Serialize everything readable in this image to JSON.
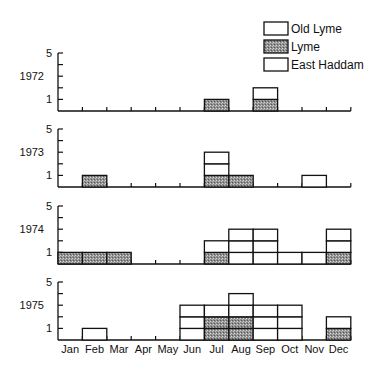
{
  "chart_data": {
    "type": "bar",
    "subtype": "stacked-histogram-small-multiples",
    "title": "",
    "xlabel": "",
    "ylabel": "",
    "categories": [
      "Jan",
      "Feb",
      "Mar",
      "Apr",
      "May",
      "Jun",
      "Jul",
      "Aug",
      "Sep",
      "Oct",
      "Nov",
      "Dec"
    ],
    "ylim": [
      0,
      5
    ],
    "yticks_labeled": [
      1,
      5
    ],
    "legend": {
      "position": "top-right",
      "entries": [
        {
          "name": "Old Lyme",
          "fill": "white"
        },
        {
          "name": "Lyme",
          "fill": "hatched"
        },
        {
          "name": "East Haddam",
          "fill": "white"
        }
      ]
    },
    "panels": [
      {
        "year": "1972",
        "stacks": {
          "Jul": [
            "Lyme"
          ],
          "Sep": [
            "Lyme",
            "white"
          ]
        },
        "totals": [
          0,
          0,
          0,
          0,
          0,
          0,
          1,
          0,
          2,
          0,
          0,
          0
        ],
        "lyme": [
          0,
          0,
          0,
          0,
          0,
          0,
          1,
          0,
          1,
          0,
          0,
          0
        ]
      },
      {
        "year": "1973",
        "stacks": {
          "Feb": [
            "Lyme"
          ],
          "Jul": [
            "Lyme",
            "white",
            "white"
          ],
          "Aug": [
            "Lyme"
          ],
          "Nov": [
            "white"
          ]
        },
        "totals": [
          0,
          1,
          0,
          0,
          0,
          0,
          3,
          1,
          0,
          0,
          1,
          0
        ],
        "lyme": [
          0,
          1,
          0,
          0,
          0,
          0,
          1,
          1,
          0,
          0,
          0,
          0
        ]
      },
      {
        "year": "1974",
        "stacks": {
          "Jan": [
            "Lyme"
          ],
          "Feb": [
            "Lyme"
          ],
          "Mar": [
            "Lyme"
          ],
          "Jul": [
            "Lyme",
            "white"
          ],
          "Aug": [
            "white",
            "white",
            "white"
          ],
          "Sep": [
            "white",
            "white",
            "white"
          ],
          "Oct": [
            "white"
          ],
          "Nov": [
            "white"
          ],
          "Dec": [
            "Lyme",
            "white",
            "white"
          ]
        },
        "totals": [
          1,
          1,
          1,
          0,
          0,
          0,
          2,
          3,
          3,
          1,
          1,
          3
        ],
        "lyme": [
          1,
          1,
          1,
          0,
          0,
          0,
          1,
          0,
          0,
          0,
          0,
          1
        ]
      },
      {
        "year": "1975",
        "stacks": {
          "Feb": [
            "white"
          ],
          "Jun": [
            "white",
            "white",
            "white"
          ],
          "Jul": [
            "Lyme",
            "Lyme",
            "white"
          ],
          "Aug": [
            "Lyme",
            "Lyme",
            "white",
            "white"
          ],
          "Sep": [
            "white",
            "white",
            "white"
          ],
          "Oct": [
            "white",
            "white",
            "white"
          ],
          "Dec": [
            "Lyme",
            "white"
          ]
        },
        "totals": [
          0,
          1,
          0,
          0,
          0,
          3,
          3,
          4,
          3,
          3,
          0,
          2
        ],
        "lyme": [
          0,
          0,
          0,
          0,
          0,
          0,
          2,
          2,
          0,
          0,
          0,
          1
        ]
      }
    ]
  },
  "colors": {
    "axis": "#111111",
    "hatch_bg": "#8a8a8a",
    "hatch_fg": "#cfcfcf",
    "white_fill": "#ffffff"
  }
}
